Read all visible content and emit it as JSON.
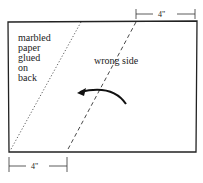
{
  "diagram": {
    "labels": {
      "back_note": [
        "marbled",
        "paper",
        "glued",
        "on",
        "back"
      ],
      "wrong_side": "wrong side"
    },
    "dimensions": {
      "top": "4\"",
      "bottom": "4\""
    },
    "elements": {
      "rectangle": "paper sheet outline",
      "dotted_line": "fold line (dotted)",
      "dashed_line": "fold line (dashed)",
      "arrow": "curved arrow pointing left (fold direction)"
    },
    "colors": {
      "line": "#222222",
      "background": "#ffffff"
    }
  }
}
